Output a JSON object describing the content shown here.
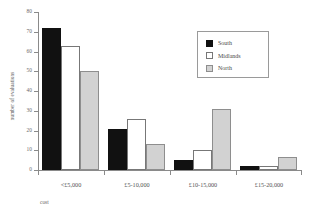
{
  "chart_data": {
    "type": "bar",
    "title": "",
    "xlabel": "cost",
    "ylabel": "number of evaluations",
    "categories": [
      "<£5,000",
      "£5-10,000",
      "£10-15,000",
      "£15-20,000"
    ],
    "series": [
      {
        "name": "South",
        "values": [
          72,
          21,
          5,
          2
        ],
        "color": "#111111"
      },
      {
        "name": "Midlands",
        "values": [
          63,
          26,
          10,
          2
        ],
        "color": "#ffffff"
      },
      {
        "name": "North",
        "values": [
          50,
          13,
          31,
          6.5
        ],
        "color": "#d2d2d2"
      }
    ],
    "ylim": [
      0,
      80
    ],
    "yticks": [
      0,
      10,
      20,
      30,
      40,
      50,
      60,
      70,
      80
    ],
    "ytick_labels": [
      "0",
      "10",
      "20",
      "30",
      "40",
      "50",
      "60",
      "70",
      "80"
    ],
    "grid": false,
    "legend_position": "upper right"
  },
  "legend": {
    "entries": [
      {
        "label": "South"
      },
      {
        "label": "Midlands"
      },
      {
        "label": "North"
      }
    ]
  }
}
